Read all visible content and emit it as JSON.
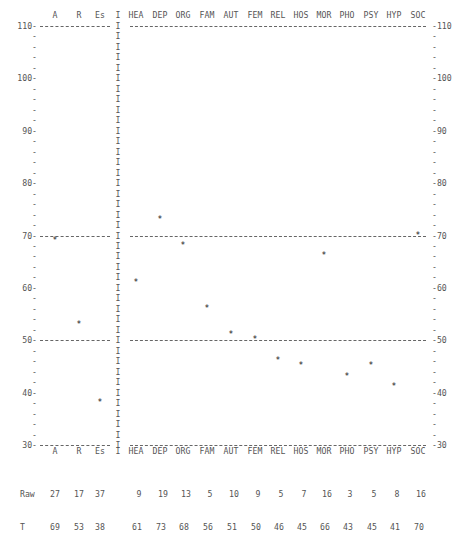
{
  "chart_data": {
    "type": "scatter",
    "title": "",
    "xlabel": "",
    "ylabel": "T",
    "ylim": [
      30,
      110
    ],
    "y_ticks": [
      30,
      40,
      50,
      60,
      70,
      80,
      90,
      100,
      110
    ],
    "reference_lines": [
      30,
      50,
      70,
      110
    ],
    "grid": false,
    "legend": "none",
    "validity_scales": {
      "categories": [
        "A",
        "R",
        "Es"
      ],
      "raw": [
        27,
        17,
        37
      ],
      "t": [
        69,
        53,
        38
      ]
    },
    "content_scales": {
      "categories": [
        "HEA",
        "DEP",
        "ORG",
        "FAM",
        "AUT",
        "FEM",
        "REL",
        "HOS",
        "MOR",
        "PHO",
        "PSY",
        "HYP",
        "SOC"
      ],
      "raw": [
        9,
        19,
        13,
        5,
        10,
        9,
        5,
        7,
        16,
        3,
        5,
        8,
        16
      ],
      "t": [
        61,
        73,
        68,
        56,
        51,
        50,
        46,
        45,
        66,
        43,
        45,
        41,
        70
      ]
    },
    "marker": "*",
    "separator_char": "I",
    "row_labels": {
      "raw": "Raw",
      "t": "T"
    }
  }
}
